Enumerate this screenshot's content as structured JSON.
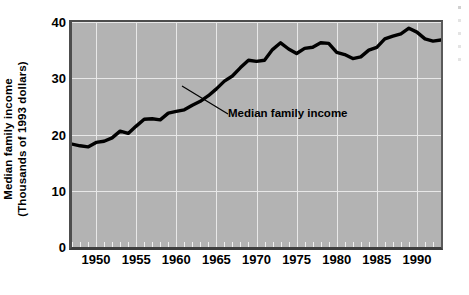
{
  "chart_data": {
    "type": "line",
    "title": "",
    "xlabel": "",
    "ylabel_line1": "Median family income",
    "ylabel_line2": "(Thousands of 1993 dollars)",
    "ylim": [
      0,
      40
    ],
    "xlim": [
      1947,
      1993
    ],
    "yticks": [
      0,
      10,
      20,
      30,
      40
    ],
    "ytick_labels": [
      "0",
      "10",
      "20",
      "30",
      "40"
    ],
    "xticks": [
      1950,
      1955,
      1960,
      1965,
      1970,
      1975,
      1980,
      1985,
      1990
    ],
    "xtick_labels": [
      "1950",
      "1955",
      "1960",
      "1965",
      "1970",
      "1975",
      "1980",
      "1985",
      "1990"
    ],
    "minor_tick_interval": 1,
    "grid": true,
    "grid_color": "#e8e8e8",
    "plot_background": "#b3b3b3",
    "line_color": "#000000",
    "line_width": 3.4,
    "legend": "none",
    "annotations": [
      {
        "text": "Median family income",
        "points_to_year": 1962,
        "points_to_value": 26.0
      }
    ],
    "series": [
      {
        "name": "Median family income",
        "x": [
          1947,
          1948,
          1949,
          1950,
          1951,
          1952,
          1953,
          1954,
          1955,
          1956,
          1957,
          1958,
          1959,
          1960,
          1961,
          1962,
          1963,
          1964,
          1965,
          1966,
          1967,
          1968,
          1969,
          1970,
          1971,
          1972,
          1973,
          1974,
          1975,
          1976,
          1977,
          1978,
          1979,
          1980,
          1981,
          1982,
          1983,
          1984,
          1985,
          1986,
          1987,
          1988,
          1989,
          1990,
          1991,
          1992,
          1993
        ],
        "values": [
          18.3,
          18.0,
          17.8,
          18.6,
          18.8,
          19.4,
          20.6,
          20.2,
          21.5,
          22.7,
          22.8,
          22.6,
          23.8,
          24.1,
          24.4,
          25.2,
          25.9,
          26.9,
          28.1,
          29.5,
          30.4,
          31.9,
          33.2,
          33.0,
          33.2,
          35.1,
          36.3,
          35.2,
          34.4,
          35.3,
          35.5,
          36.3,
          36.2,
          34.6,
          34.2,
          33.5,
          33.8,
          35.0,
          35.5,
          37.0,
          37.5,
          37.9,
          38.9,
          38.2,
          37.0,
          36.6,
          36.8
        ]
      }
    ]
  },
  "edge_artifacts": {
    "count": 5,
    "description": "cropped-page-fragments"
  }
}
